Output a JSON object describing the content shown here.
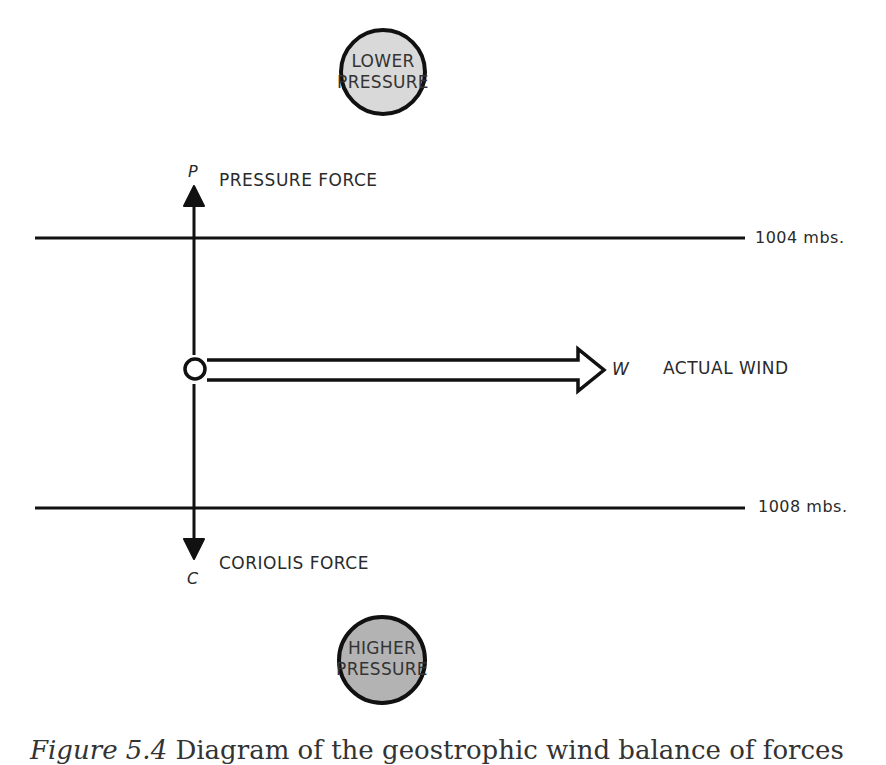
{
  "diagram": {
    "type": "geostrophic-wind-force-balance",
    "top_circle": {
      "line1": "LOWER",
      "line2": "PRESSURE",
      "fill": "#d9d9d9"
    },
    "bottom_circle": {
      "line1": "HIGHER",
      "line2": "PRESSURE",
      "fill": "#b3b3b3"
    },
    "pressure_force": {
      "symbol": "P",
      "label": "PRESSURE FORCE"
    },
    "coriolis_force": {
      "symbol": "C",
      "label": "CORIOLIS FORCE"
    },
    "wind": {
      "symbol": "W",
      "label": "ACTUAL WIND"
    },
    "isobars": [
      {
        "label": "1004 mbs."
      },
      {
        "label": "1008 mbs."
      }
    ]
  },
  "caption": {
    "figure": "Figure 5.4",
    "text": "Diagram of the geostrophic wind balance of forces"
  }
}
